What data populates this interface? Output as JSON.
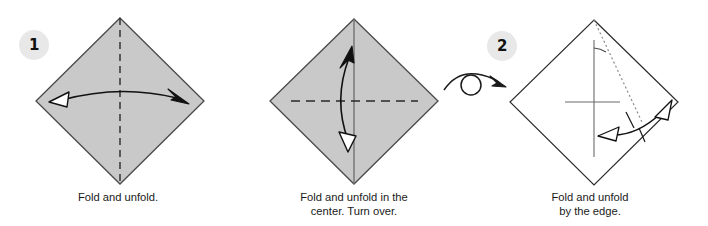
{
  "figure": {
    "type": "origami-instruction-diagram",
    "background_color": "#ffffff",
    "paper_fill_shaded": "#c9c9c9",
    "paper_fill_white": "#ffffff",
    "paper_stroke": "#4a4a4a",
    "line_color": "#1a1a1a",
    "badge_background": "#e8e8e8",
    "badge_text_color": "#111111"
  },
  "steps": [
    {
      "number": "1",
      "badge_name": "step-1-badge",
      "shape": "square rotated 45 degrees (diamond)",
      "paper_side": "shaded",
      "caption_lines": [
        "Fold and unfold."
      ],
      "fold_lines": [
        {
          "kind": "dashed",
          "orientation": "vertical",
          "meaning": "valley fold"
        }
      ],
      "arrows": [
        {
          "kind": "curved",
          "direction": "left-to-right",
          "head_left": "hollow",
          "head_right": "solid"
        }
      ]
    },
    {
      "number": "2",
      "badge_name": "step-2-badge",
      "shape": "square rotated 45 degrees (diamond)",
      "paper_side": "shaded",
      "caption_lines": [
        "Fold and unfold in the",
        "center. Turn over."
      ],
      "fold_lines": [
        {
          "kind": "solid",
          "orientation": "vertical",
          "meaning": "existing crease"
        },
        {
          "kind": "dashed",
          "orientation": "horizontal",
          "meaning": "valley fold"
        }
      ],
      "arrows": [
        {
          "kind": "curved",
          "direction": "bottom-to-top",
          "head_top": "solid",
          "head_bottom": "hollow"
        }
      ],
      "turn_over_symbol": {
        "present": true,
        "name": "turn-over-arrow",
        "description": "loop with arrow pointing right"
      }
    },
    {
      "number": "3",
      "badge_name": "step-3-badge",
      "shape": "square rotated 45 degrees (diamond)",
      "paper_side": "white",
      "caption_lines": [
        "Fold and unfold",
        "by the edge."
      ],
      "fold_lines": [
        {
          "kind": "solid",
          "orientation": "vertical",
          "meaning": "existing crease"
        },
        {
          "kind": "solid",
          "orientation": "horizontal",
          "meaning": "existing crease"
        },
        {
          "kind": "dotted",
          "orientation": "diagonal",
          "meaning": "new fold by the edge"
        }
      ],
      "angle_marker": {
        "present": true,
        "name": "angle-arc"
      },
      "arrows": [
        {
          "kind": "double-headed curved",
          "head_left": "hollow",
          "head_right": "hollow"
        }
      ]
    }
  ]
}
